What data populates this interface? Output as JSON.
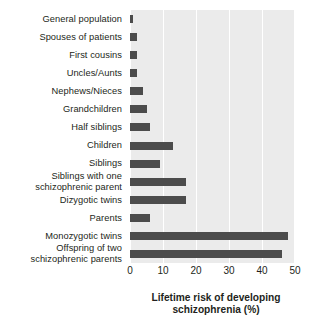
{
  "chart_data": {
    "type": "bar",
    "orientation": "horizontal",
    "title": "",
    "xlabel": "Lifetime risk of developing schizophrenia (%)",
    "xlabel_line1": "Lifetime risk of developing",
    "xlabel_line2": "schizophrenia (%)",
    "ylabel": "",
    "xlim": [
      0,
      50
    ],
    "xticks": [
      0,
      10,
      20,
      30,
      40,
      50
    ],
    "xtick_labels": [
      "0",
      "10",
      "20",
      "30",
      "40",
      "50"
    ],
    "grid": "vertical-white",
    "legend": "none",
    "bar_color": "#4c4c4c",
    "plot_background": "#ebebeb",
    "page_background": "#ffffff",
    "categories": [
      "General population",
      "Spouses of patients",
      "First cousins",
      "Uncles/Aunts",
      "Nephews/Nieces",
      "Grandchildren",
      "Half siblings",
      "Children",
      "Siblings",
      "Siblings with one schizophrenic parent",
      "Dizygotic twins",
      "Parents",
      "Monozygotic twins",
      "Offspring of two schizophrenic parents"
    ],
    "category_lines": [
      [
        "General population"
      ],
      [
        "Spouses of patients"
      ],
      [
        "First cousins"
      ],
      [
        "Uncles/Aunts"
      ],
      [
        "Nephews/Nieces"
      ],
      [
        "Grandchildren"
      ],
      [
        "Half siblings"
      ],
      [
        "Children"
      ],
      [
        "Siblings"
      ],
      [
        "Siblings with one",
        "schizophrenic parent"
      ],
      [
        "Dizygotic twins"
      ],
      [
        "Parents"
      ],
      [
        "Monozygotic twins"
      ],
      [
        "Offspring of two",
        "schizophrenic parents"
      ]
    ],
    "values": [
      1,
      2,
      2,
      2,
      4,
      5,
      6,
      13,
      9,
      17,
      17,
      6,
      48,
      46
    ]
  }
}
